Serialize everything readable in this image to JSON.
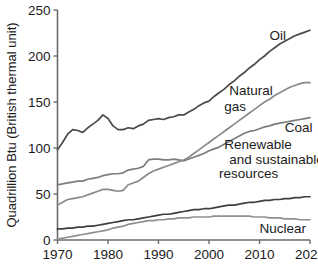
{
  "chart_data": {
    "type": "line",
    "title": "",
    "xlabel": "",
    "ylabel": "Quadrillion Btu (British thermal unit)",
    "xlim": [
      1970,
      2020
    ],
    "ylim": [
      0,
      250
    ],
    "xticks": [
      1970,
      1980,
      1990,
      2000,
      2010,
      2020
    ],
    "yticks": [
      0,
      50,
      100,
      150,
      200,
      250
    ],
    "grid": false,
    "legend_position": "inline-labels",
    "x": [
      1970,
      1971,
      1972,
      1973,
      1974,
      1975,
      1976,
      1977,
      1978,
      1979,
      1980,
      1981,
      1982,
      1983,
      1984,
      1985,
      1986,
      1987,
      1988,
      1989,
      1990,
      1991,
      1992,
      1993,
      1994,
      1995,
      1996,
      1997,
      1998,
      1999,
      2000,
      2001,
      2002,
      2003,
      2004,
      2005,
      2006,
      2007,
      2008,
      2009,
      2010,
      2011,
      2012,
      2013,
      2014,
      2015,
      2016,
      2017,
      2018,
      2019,
      2020
    ],
    "series": [
      {
        "name": "Oil",
        "label": "Oil",
        "color": "#4a4a4a",
        "values": [
          98,
          106,
          115,
          120,
          119,
          117,
          122,
          126,
          130,
          136,
          132,
          124,
          120,
          120,
          122,
          121,
          124,
          126,
          130,
          131,
          132,
          131,
          133,
          134,
          136,
          136,
          139,
          142,
          146,
          149,
          151,
          156,
          160,
          164,
          169,
          173,
          178,
          182,
          187,
          191,
          196,
          200,
          205,
          209,
          213,
          216,
          219,
          222,
          224,
          226,
          228
        ]
      },
      {
        "name": "Coal",
        "label": "Coal",
        "color": "#7d7d7d",
        "values": [
          60,
          61,
          62,
          63,
          64,
          64,
          66,
          67,
          68,
          70,
          71,
          72,
          72,
          73,
          76,
          77,
          78,
          80,
          87,
          88,
          88,
          87,
          87,
          88,
          87,
          86,
          88,
          90,
          92,
          94,
          97,
          99,
          101,
          104,
          107,
          110,
          113,
          116,
          118,
          119,
          121,
          123,
          124,
          126,
          127,
          128,
          129,
          130,
          131,
          132,
          133
        ]
      },
      {
        "name": "Natural gas",
        "label": "Natural gas",
        "color": "#8a8a8a",
        "values": [
          38,
          41,
          44,
          45,
          46,
          47,
          49,
          51,
          53,
          55,
          55,
          54,
          53,
          54,
          60,
          62,
          64,
          68,
          72,
          75,
          77,
          79,
          81,
          83,
          85,
          87,
          90,
          94,
          98,
          102,
          106,
          110,
          114,
          118,
          122,
          126,
          130,
          134,
          138,
          142,
          146,
          150,
          153,
          157,
          160,
          163,
          166,
          168,
          170,
          171,
          171
        ]
      },
      {
        "name": "Renewable and sustainable resources",
        "label": "Renewable and sustainable resources",
        "color": "#3f3f3f",
        "values": [
          12,
          12,
          13,
          13,
          14,
          14,
          15,
          15,
          16,
          17,
          18,
          19,
          20,
          21,
          22,
          22,
          23,
          24,
          25,
          26,
          27,
          28,
          28,
          29,
          30,
          31,
          32,
          33,
          33,
          34,
          34,
          35,
          36,
          37,
          38,
          38,
          39,
          40,
          41,
          41,
          42,
          43,
          43,
          44,
          44,
          45,
          45,
          46,
          46,
          47,
          47
        ]
      },
      {
        "name": "Nuclear",
        "label": "Nuclear",
        "color": "#909090",
        "values": [
          1,
          2,
          3,
          4,
          5,
          6,
          7,
          8,
          9,
          10,
          11,
          13,
          14,
          15,
          17,
          18,
          19,
          20,
          21,
          21,
          22,
          22,
          23,
          23,
          24,
          24,
          24,
          25,
          25,
          25,
          25,
          26,
          26,
          26,
          26,
          26,
          26,
          26,
          26,
          25,
          25,
          25,
          24,
          24,
          24,
          23,
          23,
          23,
          22,
          22,
          22
        ]
      }
    ],
    "annotations": [
      {
        "name": "oil-label",
        "text": "Oil",
        "x": 2012,
        "y": 222
      },
      {
        "name": "natural-gas-label",
        "text": "Natural",
        "x": 2004,
        "y": 162
      },
      {
        "name": "natural-gas-label-2",
        "text": "gas",
        "x": 2003,
        "y": 145
      },
      {
        "name": "coal-label",
        "text": "Coal",
        "x": 2015,
        "y": 122
      },
      {
        "name": "renewable-label-1",
        "text": "Renewable",
        "x": 2003,
        "y": 104
      },
      {
        "name": "renewable-label-2",
        "text": "and sustainable",
        "x": 2004,
        "y": 88
      },
      {
        "name": "renewable-label-3",
        "text": "resources",
        "x": 2002,
        "y": 72
      },
      {
        "name": "nuclear-label",
        "text": "Nuclear",
        "x": 2010,
        "y": 13
      }
    ]
  },
  "axes": {
    "y_title": "Quadrillion Btu (British thermal unit)",
    "y_tick_labels": [
      "0",
      "50",
      "100",
      "150",
      "200",
      "250"
    ],
    "x_tick_labels": [
      "1970",
      "1980",
      "1990",
      "2000",
      "2010",
      "2020"
    ]
  }
}
